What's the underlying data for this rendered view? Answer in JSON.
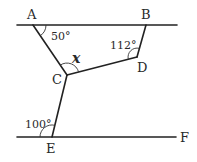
{
  "diagram": {
    "type": "geometry-parallel-lines",
    "points": {
      "A": {
        "label": "A",
        "x": 33,
        "y": 25
      },
      "B": {
        "label": "B",
        "x": 146,
        "y": 25
      },
      "C": {
        "label": "C",
        "x": 67,
        "y": 75
      },
      "D": {
        "label": "D",
        "x": 137,
        "y": 57
      },
      "E": {
        "label": "E",
        "x": 52,
        "y": 137
      },
      "F": {
        "label": "F",
        "x": 176,
        "y": 137
      }
    },
    "angles": {
      "A": "50°",
      "D": "112°",
      "C": "x",
      "E": "100°"
    },
    "colors": {
      "line": "#222222",
      "text": "#2a2a2a",
      "background": "#ffffff"
    }
  }
}
